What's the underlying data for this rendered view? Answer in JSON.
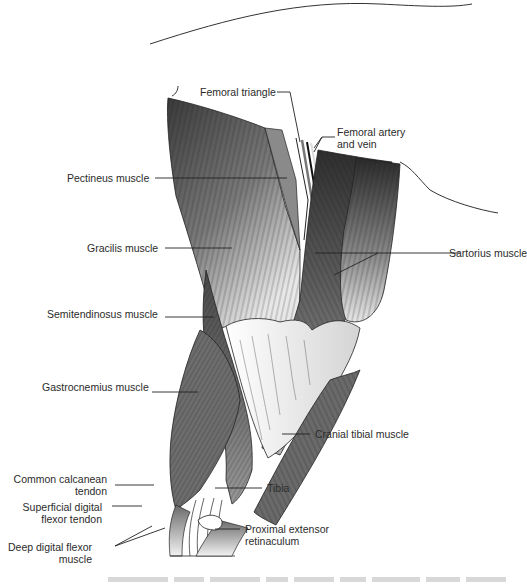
{
  "figure": {
    "type": "anatomical illustration",
    "labels": {
      "femoral_triangle": "Femoral triangle",
      "femoral_artery_vein_1": "Femoral artery",
      "femoral_artery_vein_2": "and vein",
      "pectineus": "Pectineus muscle",
      "gracilis": "Gracilis muscle",
      "sartorius": "Sartorius muscle",
      "semitendinosus": "Semitendinosus muscle",
      "gastrocnemius": "Gastrocnemius muscle",
      "cranial_tibial": "Cranial tibial muscle",
      "common_calcanean_1": "Common calcanean",
      "common_calcanean_2": "tendon",
      "sdf_tendon_1": "Superficial digital",
      "sdf_tendon_2": "flexor tendon",
      "tibia": "Tibia",
      "ddf_muscle_1": "Deep digital flexor",
      "ddf_muscle_2": "muscle",
      "prox_ext_ret_1": "Proximal extensor",
      "prox_ext_ret_2": "retinaculum"
    },
    "caption_visible": false
  }
}
